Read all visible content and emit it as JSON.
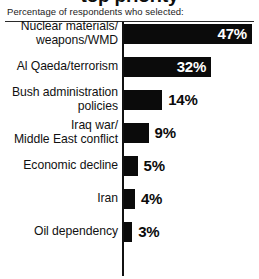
{
  "header": {
    "title_fragment": "top priority",
    "subtitle": "Percentage of respondents who selected:"
  },
  "chart_data": {
    "type": "bar",
    "orientation": "horizontal",
    "title": "",
    "subtitle": "Percentage of respondents who selected:",
    "xlabel": "",
    "ylabel": "",
    "xlim": [
      0,
      50
    ],
    "grid": false,
    "legend": false,
    "unit": "%",
    "axis_line": "left",
    "categories": [
      "Nuclear materials/\nweapons/WMD",
      "Al Qaeda/terrorism",
      "Bush administration\npolicies",
      "Iraq war/\nMiddle East conflict",
      "Economic decline",
      "Iran",
      "Oil dependency"
    ],
    "values": [
      47,
      32,
      14,
      9,
      5,
      4,
      3
    ],
    "value_labels": [
      "47%",
      "32%",
      "14%",
      "9%",
      "5%",
      "4%",
      "3%"
    ],
    "bar_color": "#0b0b0b",
    "label_inside_color": "#ffffff",
    "label_outside_color": "#0b0b0b",
    "background_color": "#ffffff"
  },
  "rows": [
    {
      "label": "Nuclear materials/\nweapons/WMD",
      "value": 47,
      "value_label": "47%",
      "label_placement": "inside",
      "label_lines": 2
    },
    {
      "label": "Al Qaeda/terrorism",
      "value": 32,
      "value_label": "32%",
      "label_placement": "inside",
      "label_lines": 1
    },
    {
      "label": "Bush administration\npolicies",
      "value": 14,
      "value_label": "14%",
      "label_placement": "outside",
      "label_lines": 2
    },
    {
      "label": "Iraq war/\nMiddle East conflict",
      "value": 9,
      "value_label": "9%",
      "label_placement": "outside",
      "label_lines": 2
    },
    {
      "label": "Economic decline",
      "value": 5,
      "value_label": "5%",
      "label_placement": "outside",
      "label_lines": 1
    },
    {
      "label": "Iran",
      "value": 4,
      "value_label": "4%",
      "label_placement": "outside",
      "label_lines": 1
    },
    {
      "label": "Oil dependency",
      "value": 3,
      "value_label": "3%",
      "label_placement": "outside",
      "label_lines": 1
    }
  ]
}
